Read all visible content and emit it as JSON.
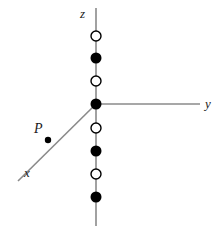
{
  "figure": {
    "width": 223,
    "height": 232,
    "background_color": "#ffffff",
    "line_color": "#8a8a8a",
    "marker_fill_color": "#000000",
    "marker_open_fill": "#ffffff",
    "marker_stroke_color": "#000000",
    "text_color": "#1a1a1a"
  },
  "axes": [
    {
      "name": "z-axis",
      "label": "z",
      "label_x": 80,
      "label_y": 7,
      "x1": 96,
      "y1": 8,
      "x2": 96,
      "y2": 226
    },
    {
      "name": "y-axis",
      "label": "y",
      "label_x": 205,
      "label_y": 97,
      "x1": 96,
      "y1": 104,
      "x2": 200,
      "y2": 104
    },
    {
      "name": "x-axis",
      "label": "x",
      "label_x": 24,
      "label_y": 166,
      "x1": 96,
      "y1": 104,
      "x2": 18,
      "y2": 181
    }
  ],
  "markers": [
    {
      "name": "open-circle-z4",
      "x": 96,
      "y": 36,
      "style": "open",
      "r": 5
    },
    {
      "name": "filled-circle-z3",
      "x": 96,
      "y": 58,
      "style": "filled",
      "r": 5.5
    },
    {
      "name": "open-circle-z2",
      "x": 96,
      "y": 81,
      "style": "open",
      "r": 5
    },
    {
      "name": "origin-marker",
      "x": 96,
      "y": 104,
      "style": "filled",
      "r": 5.5
    },
    {
      "name": "open-circle-z-1",
      "x": 96,
      "y": 128,
      "style": "open",
      "r": 5
    },
    {
      "name": "filled-circle-z-2",
      "x": 96,
      "y": 151,
      "style": "filled",
      "r": 5.5
    },
    {
      "name": "open-circle-z-3",
      "x": 96,
      "y": 174,
      "style": "open",
      "r": 5
    },
    {
      "name": "filled-circle-z-4",
      "x": 96,
      "y": 197,
      "style": "filled",
      "r": 5.5
    }
  ],
  "point_p": {
    "label": "P",
    "label_x": 34,
    "label_y": 122,
    "dot_x": 48,
    "dot_y": 140,
    "dot_r": 3.2
  }
}
